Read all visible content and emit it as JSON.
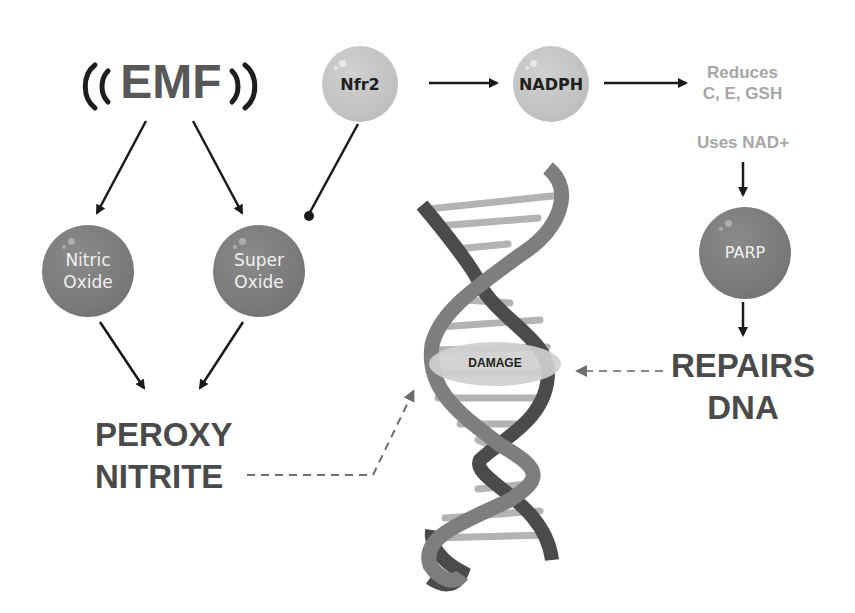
{
  "title": {
    "label": "EMF",
    "left_icon": "radio-wave-left-icon",
    "right_icon": "radio-wave-right-icon"
  },
  "nodes": {
    "nfr2": {
      "label": "Nfr2"
    },
    "nadph": {
      "label": "NADPH"
    },
    "nitric_oxide": {
      "line1": "Nitric",
      "line2": "Oxide"
    },
    "super_oxide": {
      "line1": "Super",
      "line2": "Oxide"
    },
    "parp": {
      "label": "PARP"
    }
  },
  "notes": {
    "reduces_line1": "Reduces",
    "reduces_line2": "C, E, GSH",
    "uses_nad": "Uses NAD+"
  },
  "outcomes": {
    "peroxy_line1": "PEROXY",
    "peroxy_line2": "NITRITE",
    "repairs_line1": "REPAIRS",
    "repairs_line2": "DNA"
  },
  "dna": {
    "damage_label": "DAMAGE",
    "icon": "dna-helix-icon"
  },
  "colors": {
    "light_node": "#c2c2c2",
    "dark_node": "#7a7a7a",
    "heading_text": "#4a4a4a",
    "note_text": "#a6a6a6",
    "arrow": "#1a1a1a",
    "dashed_arrow": "#6e6e6e"
  }
}
